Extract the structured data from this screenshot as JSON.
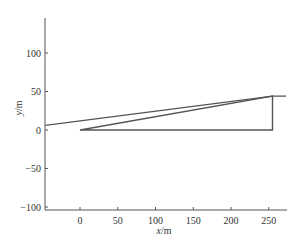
{
  "chart_data": {
    "type": "line",
    "title": "",
    "xlabel": "x/m",
    "ylabel": "y/m",
    "xlim": [
      -46,
      273
    ],
    "ylim": [
      -105,
      140
    ],
    "xticks": [
      0,
      50,
      100,
      150,
      200,
      250
    ],
    "yticks": [
      -100,
      -50,
      0,
      50,
      100
    ],
    "xtick_labels": [
      "0",
      "50",
      "100",
      "150",
      "200",
      "250"
    ],
    "ytick_labels": [
      "−100",
      "−50",
      "0",
      "50",
      "100"
    ],
    "grid": false,
    "legend": null,
    "series": [
      {
        "name": "long-line",
        "x": [
          -46,
          255,
          273
        ],
        "y": [
          6,
          44,
          44
        ],
        "color": "#555555"
      },
      {
        "name": "triangle",
        "x": [
          0,
          255,
          255,
          0
        ],
        "y": [
          0,
          0,
          44,
          0
        ],
        "color": "#555555"
      }
    ]
  },
  "axes": {
    "x_title_plain": "x",
    "x_title_unit": "/m",
    "y_title_plain": "y",
    "y_title_unit": "/m"
  }
}
